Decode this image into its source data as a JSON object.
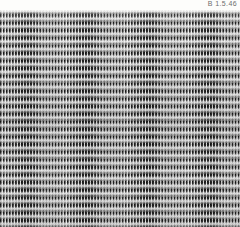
{
  "page": {
    "background_color": "#fdfdfb",
    "width_px": 240,
    "height_px": 227
  },
  "caption": {
    "plate_label": "B 1.5.46",
    "label_color": "#6d6d6d"
  },
  "texture": {
    "description": "dense woven grid texture",
    "dark_color": "#121212",
    "light_color": "#fbfbf9",
    "mid_color": "#b9b9b9",
    "stripe_period_px": "3",
    "band_period_px": "7.6",
    "top_offset_px": "10"
  }
}
